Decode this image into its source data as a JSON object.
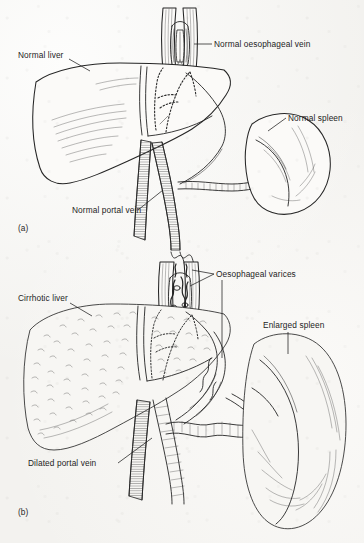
{
  "figure": {
    "background_color": "#f3f2ef",
    "ink_color": "#252525",
    "panels": [
      {
        "id": "a",
        "id_label": "(a)",
        "caption": "Normal portal venous system",
        "labels": [
          {
            "name": "normal-liver",
            "text": "Normal liver",
            "x": 18,
            "y": 58,
            "anchor": "start"
          },
          {
            "name": "normal-oesophageal-vein",
            "text": "Normal oesophageal vein",
            "x": 214,
            "y": 47,
            "anchor": "start"
          },
          {
            "name": "normal-spleen",
            "text": "Normal spleen",
            "x": 288,
            "y": 121,
            "anchor": "start"
          },
          {
            "name": "normal-portal-vein",
            "text": "Normal portal vein",
            "x": 72,
            "y": 213,
            "anchor": "start"
          }
        ],
        "structures": [
          "liver",
          "oesophagus",
          "oesophageal-vein",
          "inferior-vena-cava",
          "portal-vein",
          "splenic-vein",
          "spleen",
          "superior-mesenteric-vein"
        ]
      },
      {
        "id": "b",
        "id_label": "(b)",
        "caption": "Portal hypertension with varices and splenomegaly",
        "labels": [
          {
            "name": "cirrhotic-liver",
            "text": "Cirrhotic liver",
            "x": 18,
            "y": 301,
            "anchor": "start"
          },
          {
            "name": "oesophageal-varices",
            "text": "Oesophageal varices",
            "x": 216,
            "y": 277,
            "anchor": "start"
          },
          {
            "name": "enlarged-spleen",
            "text": "Enlarged spleen",
            "x": 263,
            "y": 328,
            "anchor": "start"
          },
          {
            "name": "dilated-portal-vein",
            "text": "Dilated portal vein",
            "x": 28,
            "y": 466,
            "anchor": "start"
          }
        ],
        "structures": [
          "cirrhotic-liver",
          "oesophagus",
          "oesophageal-varices",
          "inferior-vena-cava",
          "dilated-portal-vein",
          "dilated-splenic-vein",
          "enlarged-spleen",
          "collateral-veins"
        ]
      }
    ]
  }
}
